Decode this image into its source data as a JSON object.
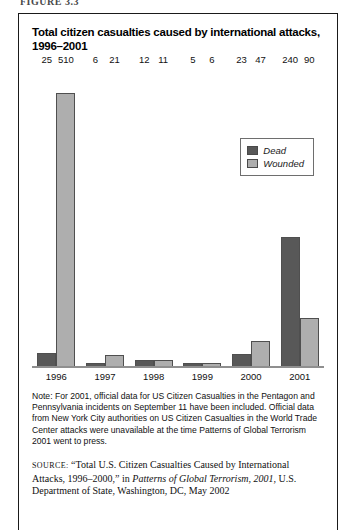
{
  "figure_label": "FIGURE 3.3",
  "chart_title": "Total citizen casualties caused by international attacks, 1996–2001",
  "legend": {
    "items": [
      {
        "label": "Dead",
        "color": "#585858"
      },
      {
        "label": "Wounded",
        "color": "#aeaeae"
      }
    ]
  },
  "note_label": "Note:",
  "note_text": "For 2001, official data for US Citizen Casualties in the Pentagon and Pennsylvania incidents on September 11 have been included. Official data from New York City authorities on US Citizen Casualties in the World Trade Center attacks were unavailable at the time Patterns of Global Terrorism 2001 went to press.",
  "source": {
    "label": "SOURCE:",
    "quoted_title": "“Total U.S. Citizen Casualties Caused by International Attacks, 1996–2000,”",
    "in_word": "in",
    "publication": "Patterns of Global Terrorism, 2001",
    "publisher": ", U.S. Department of State, Washington, DC, May 2002"
  },
  "chart_data": {
    "type": "bar",
    "title": "Total citizen casualties caused by international attacks, 1996–2001",
    "xlabel": "",
    "ylabel": "",
    "ylim": [
      0,
      560
    ],
    "grid": false,
    "legend_position": "inside-top-right",
    "categories": [
      "1996",
      "1997",
      "1998",
      "1999",
      "2000",
      "2001"
    ],
    "series": [
      {
        "name": "Dead",
        "color": "#585858",
        "values": [
          25,
          6,
          12,
          5,
          23,
          240
        ]
      },
      {
        "name": "Wounded",
        "color": "#aeaeae",
        "values": [
          510,
          21,
          11,
          6,
          47,
          90
        ]
      }
    ]
  }
}
